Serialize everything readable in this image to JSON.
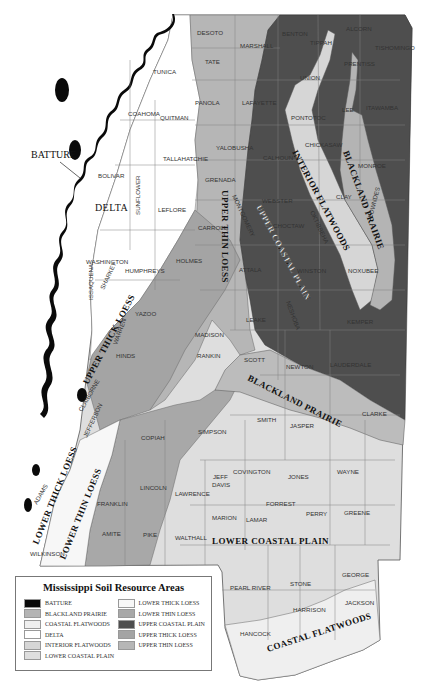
{
  "title": "Mississippi Soil Resource Areas",
  "colors": {
    "batture": "#0a0a0a",
    "blackland_prairie": "#b4b4b4",
    "coastal_flatwoods": "#efefef",
    "delta": "#ffffff",
    "interior_flatwoods": "#d6d6d6",
    "lower_coastal_plain": "#dedede",
    "lower_thick_loess": "#f7f7f7",
    "lower_thin_loess": "#a8a8a8",
    "upper_coastal_plain": "#4e4e4e",
    "upper_thick_loess": "#a4a4a4",
    "upper_thin_loess": "#b6b6b6",
    "county_line": "#808080"
  },
  "legend": {
    "title": "Mississippi Soil Resource Areas",
    "left": [
      {
        "label": "BATTURE",
        "color": "#0a0a0a"
      },
      {
        "label": "BLACKLAND PRAIRIE",
        "color": "#b4b4b4"
      },
      {
        "label": "COASTAL FLATWOODS",
        "color": "#efefef"
      },
      {
        "label": "DELTA",
        "color": "#ffffff"
      },
      {
        "label": "INTERIOR FLATWOODS",
        "color": "#d6d6d6"
      },
      {
        "label": "LOWER COASTAL PLAIN",
        "color": "#dedede"
      }
    ],
    "right": [
      {
        "label": "LOWER THICK LOESS",
        "color": "#f7f7f7"
      },
      {
        "label": "LOWER THIN LOESS",
        "color": "#a8a8a8"
      },
      {
        "label": "UPPER COASTAL PLAIN",
        "color": "#4e4e4e"
      },
      {
        "label": "UPPER THICK LOESS",
        "color": "#a4a4a4"
      },
      {
        "label": "UPPER THIN LOESS",
        "color": "#b6b6b6"
      }
    ]
  },
  "regions": {
    "batture": "BATTURE",
    "delta": "DELTA",
    "upper_thin_loess": "UPPER THIN LOESS",
    "upper_thick_loess": "UPPER THICK LOESS",
    "upper_coastal_plain": "UPPER COASTAL PLAIN",
    "interior_flatwoods": "INTERIOR FLATWOODS",
    "blackland_prairie_north": "BLACKLAND PRAIRIE",
    "blackland_prairie_south": "BLACKLAND PRAIRIE",
    "lower_thick_loess": "LOWER THICK LOESS",
    "lower_thin_loess": "LOWER THIN LOESS",
    "lower_coastal_plain": "LOWER COASTAL PLAIN",
    "coastal_flatwoods": "COASTAL FLATWOODS"
  },
  "counties": [
    "DESOTO",
    "MARSHALL",
    "BENTON",
    "TIPPAH",
    "ALCORN",
    "TISHOMINGO",
    "TUNICA",
    "TATE",
    "PRENTISS",
    "UNION",
    "COAHOMA",
    "QUITMAN",
    "PANOLA",
    "LAFAYETTE",
    "PONTOTOC",
    "LEE",
    "ITAWAMBA",
    "TALLAHATCHIE",
    "YALOBUSHA",
    "CALHOUN",
    "CHICKASAW",
    "MONROE",
    "BOLIVAR",
    "SUNFLOWER",
    "LEFLORE",
    "GRENADA",
    "WEBSTER",
    "CLAY",
    "CARROLL",
    "MONTGOMERY",
    "CHOCTAW",
    "OKTIBBEHA",
    "LOWNDES",
    "WASHINGTON",
    "HUMPHREYS",
    "HOLMES",
    "ATTALA",
    "WINSTON",
    "NOXUBEE",
    "SHARKEY",
    "ISSAQUENA",
    "YAZOO",
    "MADISON",
    "LEAKE",
    "NESHOBA",
    "KEMPER",
    "WARREN",
    "HINDS",
    "RANKIN",
    "SCOTT",
    "NEWTON",
    "LAUDERDALE",
    "CLAIBORNE",
    "CLARKE",
    "SMITH",
    "JASPER",
    "JEFFERSON",
    "COPIAH",
    "SIMPSON",
    "COVINGTON",
    "JONES",
    "WAYNE",
    "LINCOLN",
    "LAWRENCE",
    "JEFF",
    "DAVIS",
    "FRANKLIN",
    "FORREST",
    "PERRY",
    "GREENE",
    "ADAMS",
    "MARION",
    "LAMAR",
    "AMITE",
    "PIKE",
    "WALTHALL",
    "WILKINSON",
    "GEORGE",
    "PEARL RIVER",
    "STONE",
    "HARRISON",
    "JACKSON",
    "HANCOCK"
  ]
}
